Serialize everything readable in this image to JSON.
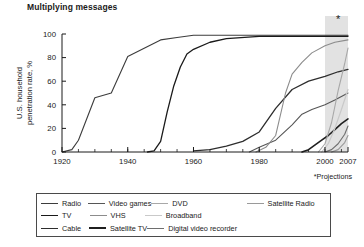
{
  "chart_data": {
    "type": "line",
    "title": "Multiplying messages",
    "xlabel": "",
    "ylabel": "U.S. household penetration rate, %",
    "xlim": [
      1920,
      2007
    ],
    "ylim": [
      0,
      100
    ],
    "xticks": [
      1920,
      1940,
      1960,
      1980,
      2000,
      2007
    ],
    "xtick_labels": [
      "1920",
      "1940",
      "1960",
      "1980",
      "2000",
      "2007"
    ],
    "yticks": [
      0,
      20,
      40,
      60,
      80,
      100
    ],
    "ytick_labels": [
      "0",
      "20",
      "40",
      "60",
      "80",
      "100"
    ],
    "grid": false,
    "legend_position": "bottom",
    "footnote": "*Projections",
    "projection_band": {
      "start": 2000,
      "end": 2007,
      "marker": "*",
      "marker_x": 2004,
      "marker_y": 103,
      "color": "#e2e2e2"
    },
    "series": [
      {
        "name": "Radio",
        "color": "#3c3c3c",
        "width": 1.1,
        "points": [
          [
            1920,
            0
          ],
          [
            1923,
            2
          ],
          [
            1925,
            10
          ],
          [
            1930,
            46
          ],
          [
            1935,
            50
          ],
          [
            1940,
            81
          ],
          [
            1945,
            88
          ],
          [
            1950,
            95
          ],
          [
            1955,
            97
          ],
          [
            1960,
            99
          ],
          [
            1970,
            99
          ],
          [
            1980,
            99
          ],
          [
            1990,
            99
          ],
          [
            2000,
            99
          ],
          [
            2007,
            99
          ]
        ]
      },
      {
        "name": "TV",
        "color": "#1a1a1a",
        "width": 1.3,
        "points": [
          [
            1946,
            0
          ],
          [
            1948,
            1
          ],
          [
            1950,
            9
          ],
          [
            1952,
            34
          ],
          [
            1954,
            56
          ],
          [
            1956,
            72
          ],
          [
            1958,
            83
          ],
          [
            1960,
            87
          ],
          [
            1965,
            93
          ],
          [
            1970,
            96
          ],
          [
            1980,
            98
          ],
          [
            1990,
            98
          ],
          [
            2000,
            98
          ],
          [
            2007,
            98
          ]
        ]
      },
      {
        "name": "Cable",
        "color": "#2d2d2d",
        "width": 1.3,
        "points": [
          [
            1960,
            1
          ],
          [
            1965,
            2
          ],
          [
            1970,
            5
          ],
          [
            1975,
            9
          ],
          [
            1980,
            17
          ],
          [
            1985,
            37
          ],
          [
            1990,
            53
          ],
          [
            1995,
            60
          ],
          [
            2000,
            64
          ],
          [
            2004,
            68
          ],
          [
            2007,
            70
          ]
        ]
      },
      {
        "name": "Video games",
        "color": "#565656",
        "width": 1.1,
        "points": [
          [
            1977,
            0
          ],
          [
            1980,
            4
          ],
          [
            1985,
            10
          ],
          [
            1990,
            23
          ],
          [
            1993,
            32
          ],
          [
            1996,
            36
          ],
          [
            2000,
            40
          ],
          [
            2003,
            44
          ],
          [
            2007,
            50
          ]
        ]
      },
      {
        "name": "VHS",
        "color": "#8c8c8c",
        "width": 1.1,
        "points": [
          [
            1979,
            0
          ],
          [
            1982,
            4
          ],
          [
            1985,
            14
          ],
          [
            1988,
            50
          ],
          [
            1990,
            66
          ],
          [
            1993,
            76
          ],
          [
            1996,
            84
          ],
          [
            2000,
            90
          ],
          [
            2003,
            93
          ],
          [
            2007,
            95
          ]
        ]
      },
      {
        "name": "Satellite TV",
        "color": "#1f1f1f",
        "width": 1.6,
        "points": [
          [
            1993,
            0
          ],
          [
            1995,
            2
          ],
          [
            1997,
            6
          ],
          [
            1999,
            10
          ],
          [
            2001,
            14
          ],
          [
            2003,
            19
          ],
          [
            2005,
            24
          ],
          [
            2007,
            28
          ]
        ]
      },
      {
        "name": "DVD",
        "color": "#a8a8a8",
        "width": 1.1,
        "points": [
          [
            1998,
            0
          ],
          [
            2000,
            7
          ],
          [
            2002,
            25
          ],
          [
            2004,
            52
          ],
          [
            2006,
            75
          ],
          [
            2007,
            88
          ]
        ]
      },
      {
        "name": "Broadband",
        "color": "#c9c9c9",
        "width": 1.2,
        "points": [
          [
            1999,
            0
          ],
          [
            2001,
            7
          ],
          [
            2003,
            20
          ],
          [
            2005,
            36
          ],
          [
            2007,
            53
          ]
        ]
      },
      {
        "name": "Digital video recorder",
        "color": "#6e6e6e",
        "width": 1.1,
        "points": [
          [
            2000,
            0
          ],
          [
            2002,
            2
          ],
          [
            2004,
            7
          ],
          [
            2006,
            15
          ],
          [
            2007,
            22
          ]
        ]
      },
      {
        "name": "Satellite Radio",
        "color": "#9a9a9a",
        "width": 1.1,
        "points": [
          [
            2002,
            0
          ],
          [
            2004,
            2
          ],
          [
            2006,
            8
          ],
          [
            2007,
            14
          ]
        ]
      }
    ]
  },
  "legend": {
    "rows": [
      [
        {
          "label": "Radio",
          "color": "#3c3c3c",
          "width": 1.4,
          "col": "col1"
        },
        {
          "label": "Video games",
          "color": "#565656",
          "width": 1.4,
          "col": "col2"
        },
        {
          "label": "DVD",
          "color": "#a8a8a8",
          "width": 1.4,
          "col": "col3"
        },
        {
          "label": "Satellite Radio",
          "color": "#9a9a9a",
          "width": 1.4,
          "col": "col4"
        }
      ],
      [
        {
          "label": "TV",
          "color": "#1a1a1a",
          "width": 1.8,
          "col": "col1"
        },
        {
          "label": "VHS",
          "color": "#8c8c8c",
          "width": 1.4,
          "col": "col2"
        },
        {
          "label": "Broadband",
          "color": "#c9c9c9",
          "width": 1.8,
          "col": "col3"
        },
        {
          "label": "",
          "color": "transparent",
          "width": 0,
          "col": "col4"
        }
      ],
      [
        {
          "label": "Cable",
          "color": "#2d2d2d",
          "width": 1.6,
          "col": "col1"
        },
        {
          "label": "Satellite TV",
          "color": "#1f1f1f",
          "width": 2.2,
          "col": "col2"
        },
        {
          "label": "Digital video recorder",
          "color": "#6e6e6e",
          "width": 1.4,
          "col": "col3"
        },
        {
          "label": "",
          "color": "transparent",
          "width": 0,
          "col": "col4"
        }
      ]
    ]
  }
}
